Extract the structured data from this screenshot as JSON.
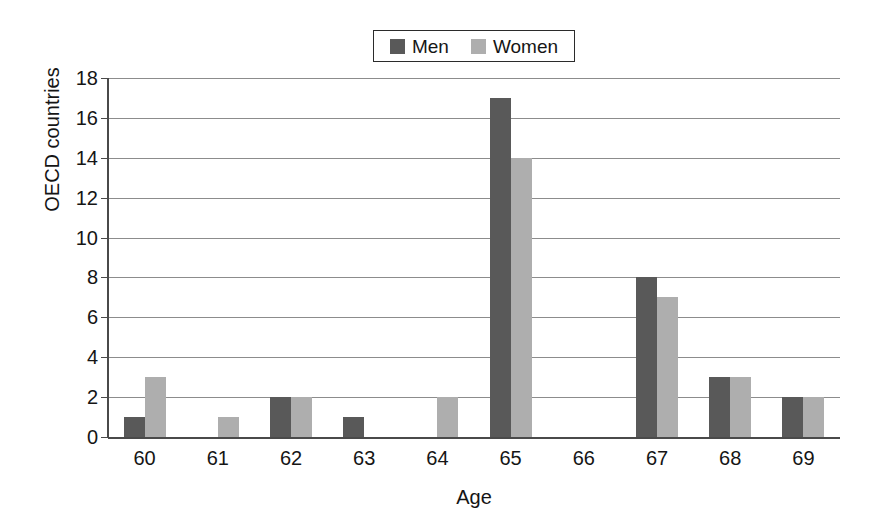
{
  "legend": {
    "position": "top-center",
    "entries": [
      {
        "label": "Men",
        "color": "#595959",
        "swatch_name": "legend-swatch-men"
      },
      {
        "label": "Women",
        "color": "#aeaeae",
        "swatch_name": "legend-swatch-women"
      }
    ]
  },
  "chart_data": {
    "type": "bar",
    "title": "",
    "subtitle": "",
    "xlabel": "Age",
    "ylabel": "OECD countries",
    "categories": [
      "60",
      "61",
      "62",
      "63",
      "64",
      "65",
      "66",
      "67",
      "68",
      "69"
    ],
    "series": [
      {
        "name": "Men",
        "color": "#595959",
        "values": [
          1,
          0,
          2,
          1,
          0,
          17,
          0,
          8,
          3,
          2
        ]
      },
      {
        "name": "Women",
        "color": "#aeaeae",
        "values": [
          3,
          1,
          2,
          0,
          2,
          14,
          0,
          7,
          3,
          2
        ]
      }
    ],
    "ylim": [
      0,
      18
    ],
    "ytick_step": 2,
    "yticks": [
      0,
      2,
      4,
      6,
      8,
      10,
      12,
      14,
      16,
      18
    ],
    "grid": true,
    "grid_axis": "y",
    "legend_position": "top-center",
    "annotations": []
  },
  "colors": {
    "men_bar": "#595959",
    "women_bar": "#aeaeae",
    "gridline": "#8c8c8c",
    "axis": "#4a4a4a",
    "text": "#151515",
    "background": "#ffffff"
  }
}
